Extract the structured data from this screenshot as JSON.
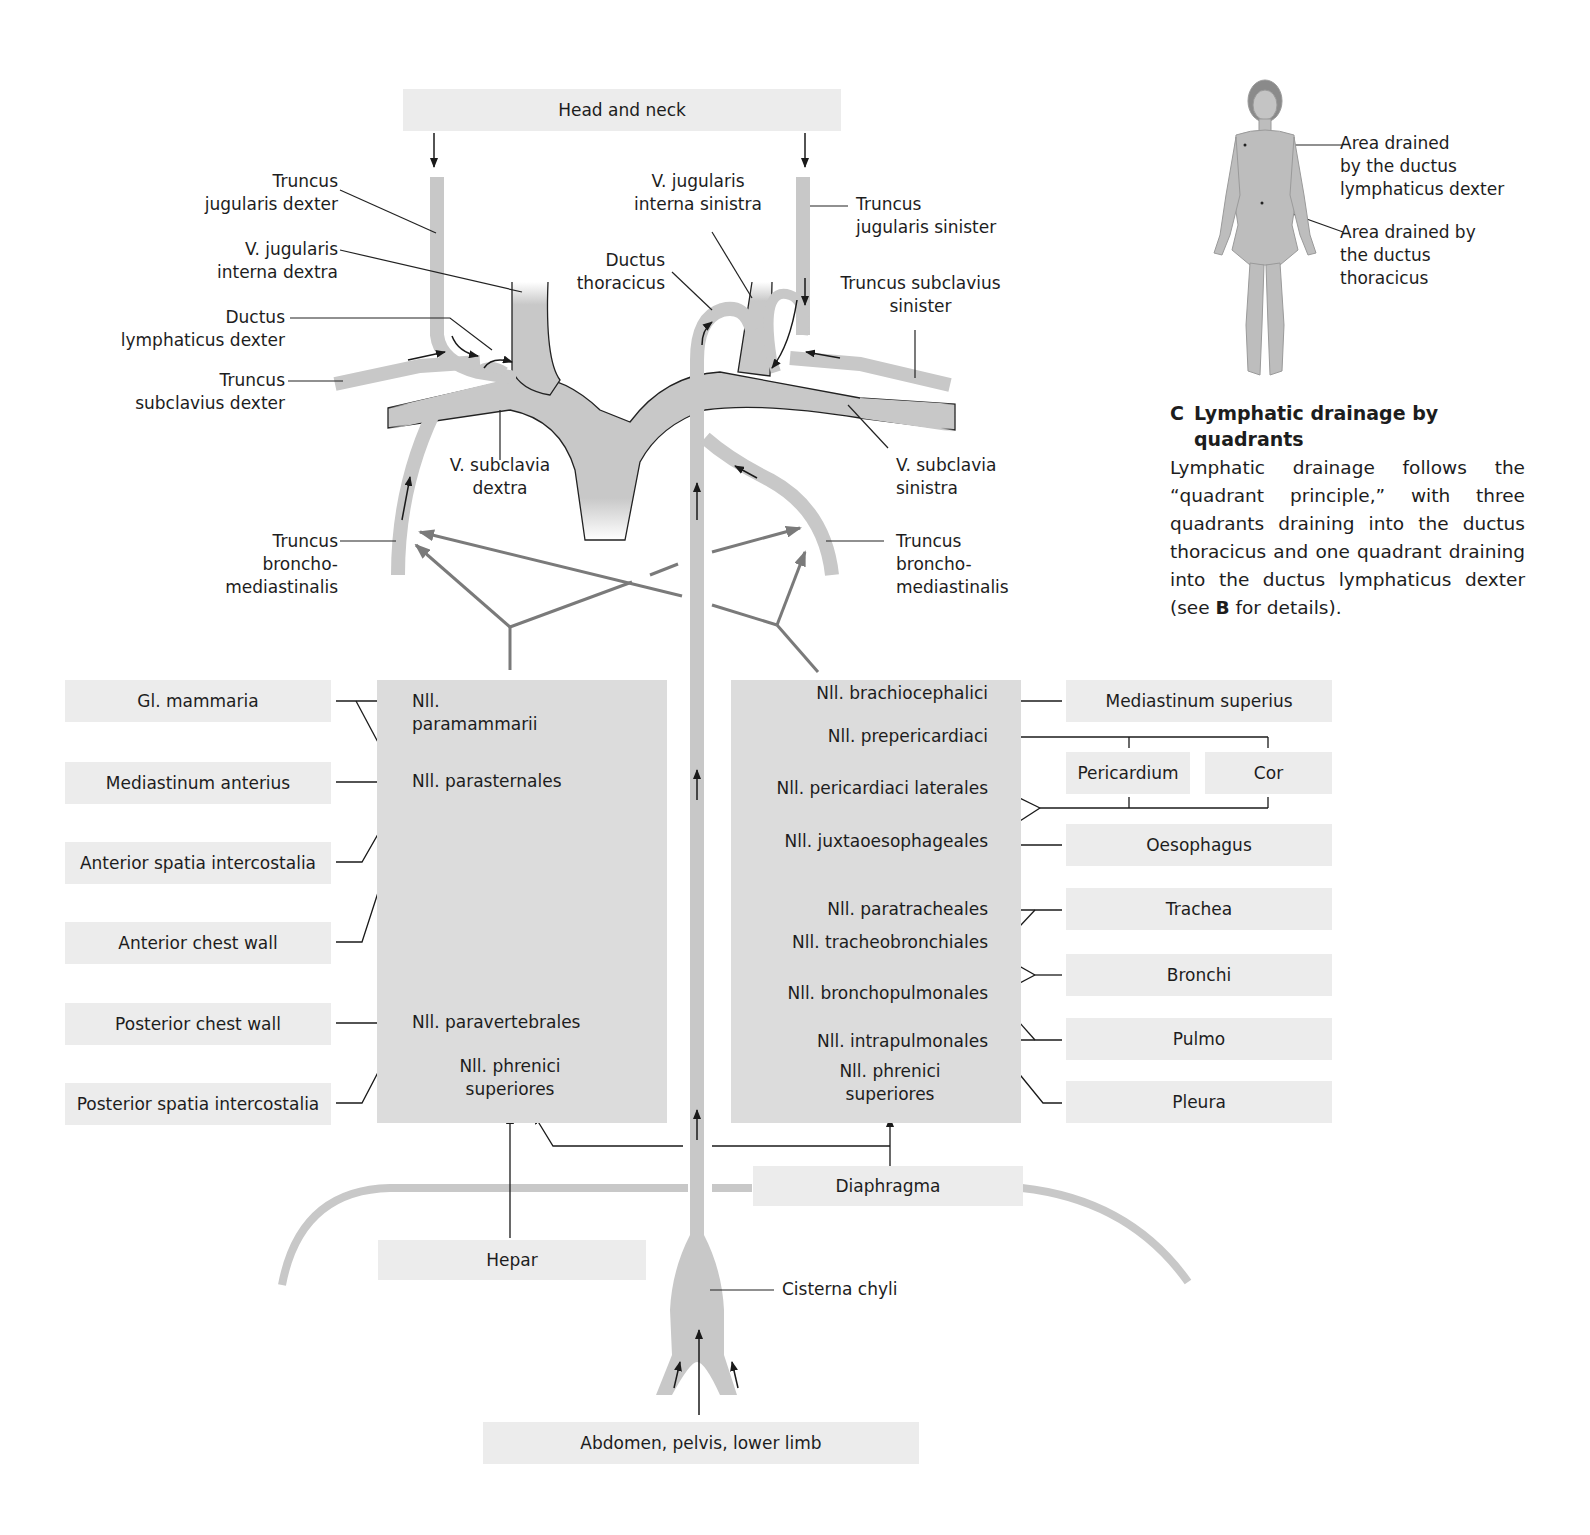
{
  "diagram": {
    "sources": {
      "head_neck": "Head and neck",
      "abdomen": "Abdomen, pelvis, lower limb",
      "hepar": "Hepar",
      "diaphragma": "Diaphragma"
    },
    "vessel_labels": {
      "truncus_jugularis_dexter": [
        "Truncus",
        "jugularis dexter"
      ],
      "v_jugularis_interna_dextra": [
        "V. jugularis",
        "interna dextra"
      ],
      "ductus_lymphaticus_dexter": [
        "Ductus",
        "lymphaticus dexter"
      ],
      "truncus_subclavius_dexter": [
        "Truncus",
        "subclavius dexter"
      ],
      "v_subclavia_dextra": [
        "V. subclavia",
        "dextra"
      ],
      "truncus_bronchomediastinalis_dexter": [
        "Truncus",
        "broncho-",
        "mediastinalis"
      ],
      "v_jugularis_interna_sinistra": [
        "V. jugularis",
        "interna sinistra"
      ],
      "ductus_thoracicus": [
        "Ductus",
        "thoracicus"
      ],
      "truncus_jugularis_sinister": [
        "Truncus",
        "jugularis sinister"
      ],
      "truncus_subclavius_sinister": [
        "Truncus subclavius",
        "sinister"
      ],
      "v_subclavia_sinistra": [
        "V. subclavia",
        "sinistra"
      ],
      "truncus_bronchomediastinalis_sinister": [
        "Truncus",
        "broncho-",
        "mediastinalis"
      ],
      "cisterna_chyli": "Cisterna chyli"
    },
    "left_sources": [
      "Gl. mammaria",
      "Mediastinum anterius",
      "Anterior spatia intercostalia",
      "Anterior chest wall",
      "Posterior chest wall",
      "Posterior spatia intercostalia"
    ],
    "left_nodes": {
      "paramammarii": [
        "Nll.",
        "paramammarii"
      ],
      "parasternales": "Nll. parasternales",
      "paravertebrales": "Nll. paravertebrales",
      "phrenici_superiores": [
        "Nll. phrenici",
        "superiores"
      ]
    },
    "right_nodes": {
      "brachiocephalici": "Nll. brachiocephalici",
      "prepericardiaci": "Nll. prepericardiaci",
      "pericardiaci_laterales": "Nll. pericardiaci laterales",
      "juxtaoesophageales": "Nll. juxtaoesophageales",
      "paratracheales": "Nll. paratracheales",
      "tracheobronchiales": "Nll. tracheobronchiales",
      "bronchopulmonales": "Nll. bronchopulmonales",
      "intrapulmonales": "Nll. intrapulmonales",
      "phrenici_superiores": [
        "Nll. phrenici",
        "superiores"
      ]
    },
    "right_sources": {
      "mediastinum_superius": "Mediastinum superius",
      "pericardium": "Pericardium",
      "cor": "Cor",
      "oesophagus": "Oesophagus",
      "trachea": "Trachea",
      "bronchi": "Bronchi",
      "pulmo": "Pulmo",
      "pleura": "Pleura"
    },
    "colors": {
      "vessel": "#c8c8c8",
      "node_region": "#dcdcdc",
      "source_box": "#ececec",
      "arrow_dark": "#1a1a1a",
      "arrow_gray": "#7a7a7a"
    }
  },
  "inset": {
    "figure_icon": "female-body-figure",
    "label_right": [
      "Area drained",
      "by the ductus",
      "lymphaticus dexter"
    ],
    "label_thoracicus": [
      "Area drained by",
      "the ductus",
      "thoracicus"
    ]
  },
  "caption": {
    "letter": "C",
    "title_line1": "Lymphatic drainage by",
    "title_line2": "quadrants",
    "body_prefix": "Lymphatic drainage follows the “quadrant principle,” with three quadrants draining into the ductus thoracicus and one quadrant draining into the ductus lymphaticus dexter (see ",
    "body_bold": "B",
    "body_suffix": " for details)."
  }
}
